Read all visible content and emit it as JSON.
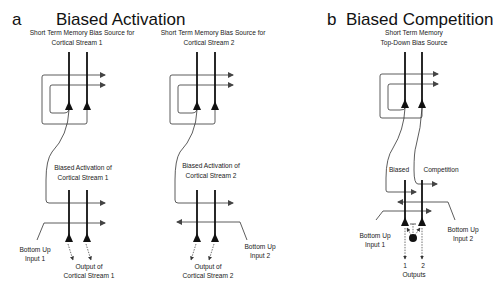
{
  "panel_a": {
    "letter": "a",
    "title": "Biased Activation",
    "stream1": {
      "source_label_line1": "Short Term Memory Bias Source for",
      "source_label_line2": "Cortical Stream 1",
      "activation_label_line1": "Biased Activation of",
      "activation_label_line2": "Cortical Stream 1",
      "input_label_line1": "Bottom Up",
      "input_label_line2": "Input 1",
      "output_label_line1": "Output of",
      "output_label_line2": "Cortical Stream 1"
    },
    "stream2": {
      "source_label_line1": "Short Term Memory Bias Source for",
      "source_label_line2": "Cortical Stream 2",
      "activation_label_line1": "Biased Activation of",
      "activation_label_line2": "Cortical Stream 2",
      "input_label_line1": "Bottom Up",
      "input_label_line2": "Input 2",
      "output_label_line1": "Output of",
      "output_label_line2": "Cortical Stream 2"
    }
  },
  "panel_b": {
    "letter": "b",
    "title": "Biased Competition",
    "source_label_line1": "Short Term Memory",
    "source_label_line2": "Top-Down Bias Source",
    "label_left": "Biased",
    "label_right": "Competition",
    "input1_line1": "Bottom Up",
    "input1_line2": "Input 1",
    "input2_line1": "Bottom Up",
    "input2_line2": "Input 2",
    "output_1": "1",
    "output_2": "2",
    "outputs_label": "Outputs"
  }
}
